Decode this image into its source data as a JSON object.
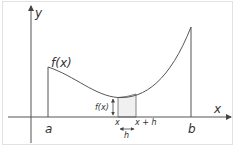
{
  "diagram": {
    "labels": {
      "y_axis": "y",
      "x_axis": "x",
      "curve": "f(x)",
      "height": "f(x)",
      "a": "a",
      "b": "b",
      "x": "x",
      "x_plus_h": "x + h",
      "h": "h"
    },
    "colors": {
      "line": "#555555",
      "strip_fill": "#f0f0f0",
      "frame": "#e2e2e2",
      "text": "#333333"
    }
  }
}
